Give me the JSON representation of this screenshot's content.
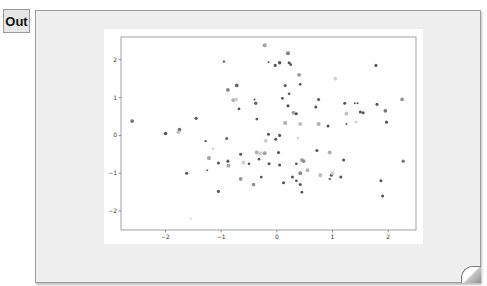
{
  "cell": {
    "prompt_label": "Out"
  },
  "chart_data": {
    "type": "scatter",
    "title": "",
    "xlabel": "",
    "ylabel": "",
    "xlim": [
      -2.8,
      2.5
    ],
    "ylim": [
      -2.5,
      2.6
    ],
    "grid": false,
    "legend": null,
    "xticks": [
      "-2",
      "-1",
      "0",
      "1",
      "2"
    ],
    "yticks": [
      "-2",
      "-1",
      "0",
      "1",
      "2"
    ],
    "points": [
      {
        "x": -2.6,
        "y": 0.38,
        "c": "#666666",
        "s": 2.2
      },
      {
        "x": -2.0,
        "y": 0.05,
        "c": "#444444",
        "s": 2.0
      },
      {
        "x": -1.75,
        "y": 0.15,
        "c": "#666666",
        "s": 2.2
      },
      {
        "x": -1.77,
        "y": 0.08,
        "c": "#bbbbbb",
        "s": 2.2
      },
      {
        "x": -1.45,
        "y": 0.45,
        "c": "#444444",
        "s": 1.8
      },
      {
        "x": -1.62,
        "y": -1.0,
        "c": "#444444",
        "s": 1.8
      },
      {
        "x": -1.55,
        "y": -2.2,
        "c": "#dddddd",
        "s": 1.6
      },
      {
        "x": -1.28,
        "y": -0.15,
        "c": "#444444",
        "s": 1.4
      },
      {
        "x": -1.22,
        "y": -0.6,
        "c": "#999999",
        "s": 2.4
      },
      {
        "x": -1.25,
        "y": -0.92,
        "c": "#555555",
        "s": 1.2
      },
      {
        "x": -1.15,
        "y": -0.35,
        "c": "#cccccc",
        "s": 1.4
      },
      {
        "x": -1.05,
        "y": -0.73,
        "c": "#444444",
        "s": 1.8
      },
      {
        "x": -1.05,
        "y": -1.48,
        "c": "#444444",
        "s": 1.8
      },
      {
        "x": -0.95,
        "y": 1.95,
        "c": "#444444",
        "s": 1.4
      },
      {
        "x": -0.88,
        "y": 1.2,
        "c": "#777777",
        "s": 2.2
      },
      {
        "x": -0.78,
        "y": 0.93,
        "c": "#aaaaaa",
        "s": 2.4
      },
      {
        "x": -0.73,
        "y": 0.95,
        "c": "#cccccc",
        "s": 2.2
      },
      {
        "x": -0.72,
        "y": 1.32,
        "c": "#555555",
        "s": 2.2
      },
      {
        "x": -0.88,
        "y": -0.68,
        "c": "#444444",
        "s": 1.8
      },
      {
        "x": -0.87,
        "y": -0.8,
        "c": "#999999",
        "s": 2.2
      },
      {
        "x": -0.9,
        "y": -0.08,
        "c": "#555555",
        "s": 1.8
      },
      {
        "x": -0.68,
        "y": 0.7,
        "c": "#444444",
        "s": 1.6
      },
      {
        "x": -0.65,
        "y": -1.15,
        "c": "#888888",
        "s": 2.2
      },
      {
        "x": -0.65,
        "y": -0.5,
        "c": "#444444",
        "s": 1.8
      },
      {
        "x": -0.6,
        "y": -0.72,
        "c": "#cccccc",
        "s": 2.4
      },
      {
        "x": -0.5,
        "y": -0.75,
        "c": "#444444",
        "s": 1.6
      },
      {
        "x": -0.42,
        "y": -1.3,
        "c": "#888888",
        "s": 2.2
      },
      {
        "x": -0.36,
        "y": 0.43,
        "c": "#444444",
        "s": 1.6
      },
      {
        "x": -0.36,
        "y": -0.45,
        "c": "#aaaaaa",
        "s": 2.4
      },
      {
        "x": -0.3,
        "y": -0.47,
        "c": "#cccccc",
        "s": 2.4
      },
      {
        "x": -0.22,
        "y": -0.47,
        "c": "#999999",
        "s": 2.4
      },
      {
        "x": -0.32,
        "y": -0.63,
        "c": "#444444",
        "s": 1.6
      },
      {
        "x": -0.28,
        "y": -1.1,
        "c": "#444444",
        "s": 1.6
      },
      {
        "x": -0.4,
        "y": 0.95,
        "c": "#444444",
        "s": 1.2
      },
      {
        "x": -0.38,
        "y": 0.85,
        "c": "#555555",
        "s": 2.0
      },
      {
        "x": -0.14,
        "y": -0.75,
        "c": "#444444",
        "s": 1.8
      },
      {
        "x": -0.2,
        "y": -0.14,
        "c": "#cccccc",
        "s": 2.4
      },
      {
        "x": -0.15,
        "y": 0.03,
        "c": "#444444",
        "s": 1.8
      },
      {
        "x": -0.22,
        "y": 2.38,
        "c": "#999999",
        "s": 2.4
      },
      {
        "x": -0.15,
        "y": 1.93,
        "c": "#444444",
        "s": 1.2
      },
      {
        "x": -0.03,
        "y": 1.85,
        "c": "#444444",
        "s": 1.8
      },
      {
        "x": 0.05,
        "y": 1.92,
        "c": "#444444",
        "s": 2.0
      },
      {
        "x": -0.02,
        "y": -0.1,
        "c": "#444444",
        "s": 1.8
      },
      {
        "x": 0.03,
        "y": -0.45,
        "c": "#444444",
        "s": 1.8
      },
      {
        "x": 0.05,
        "y": 0.0,
        "c": "#444444",
        "s": 1.8
      },
      {
        "x": 0.05,
        "y": -0.78,
        "c": "#444444",
        "s": 1.8
      },
      {
        "x": 0.15,
        "y": 0.33,
        "c": "#aaaaaa",
        "s": 2.4
      },
      {
        "x": 0.12,
        "y": -1.25,
        "c": "#444444",
        "s": 1.8
      },
      {
        "x": 0.1,
        "y": 0.98,
        "c": "#444444",
        "s": 1.6
      },
      {
        "x": 0.15,
        "y": 1.32,
        "c": "#444444",
        "s": 1.8
      },
      {
        "x": 0.2,
        "y": 2.17,
        "c": "#777777",
        "s": 2.4
      },
      {
        "x": 0.22,
        "y": 1.92,
        "c": "#444444",
        "s": 1.8
      },
      {
        "x": 0.25,
        "y": 1.87,
        "c": "#444444",
        "s": 1.6
      },
      {
        "x": 0.22,
        "y": 1.1,
        "c": "#444444",
        "s": 1.6
      },
      {
        "x": 0.2,
        "y": 0.78,
        "c": "#444444",
        "s": 1.8
      },
      {
        "x": 0.3,
        "y": 0.6,
        "c": "#999999",
        "s": 2.4
      },
      {
        "x": 0.28,
        "y": -1.1,
        "c": "#444444",
        "s": 1.8
      },
      {
        "x": 0.35,
        "y": 0.57,
        "c": "#444444",
        "s": 1.8
      },
      {
        "x": 0.4,
        "y": 1.6,
        "c": "#888888",
        "s": 2.2
      },
      {
        "x": 0.42,
        "y": 1.35,
        "c": "#444444",
        "s": 1.6
      },
      {
        "x": 0.42,
        "y": 0.3,
        "c": "#bbbbbb",
        "s": 2.4
      },
      {
        "x": 0.38,
        "y": -0.07,
        "c": "#cccccc",
        "s": 1.4
      },
      {
        "x": 0.42,
        "y": -1.0,
        "c": "#777777",
        "s": 2.2
      },
      {
        "x": 0.42,
        "y": -1.3,
        "c": "#444444",
        "s": 1.8
      },
      {
        "x": 0.45,
        "y": -1.5,
        "c": "#444444",
        "s": 1.6
      },
      {
        "x": 0.45,
        "y": -0.65,
        "c": "#999999",
        "s": 2.2
      },
      {
        "x": 0.48,
        "y": -0.68,
        "c": "#888888",
        "s": 2.2
      },
      {
        "x": 0.35,
        "y": -0.75,
        "c": "#444444",
        "s": 1.6
      },
      {
        "x": 0.35,
        "y": -1.2,
        "c": "#444444",
        "s": 1.6
      },
      {
        "x": 0.55,
        "y": -0.92,
        "c": "#aaaaaa",
        "s": 2.2
      },
      {
        "x": 0.7,
        "y": 0.75,
        "c": "#444444",
        "s": 1.8
      },
      {
        "x": 0.75,
        "y": 0.95,
        "c": "#444444",
        "s": 1.8
      },
      {
        "x": 0.78,
        "y": -1.05,
        "c": "#bbbbbb",
        "s": 2.4
      },
      {
        "x": 0.72,
        "y": -0.4,
        "c": "#444444",
        "s": 1.8
      },
      {
        "x": 0.75,
        "y": 0.3,
        "c": "#aaaaaa",
        "s": 2.4
      },
      {
        "x": 0.92,
        "y": 0.25,
        "c": "#444444",
        "s": 1.8
      },
      {
        "x": 0.95,
        "y": -0.45,
        "c": "#aaaaaa",
        "s": 2.4
      },
      {
        "x": 0.95,
        "y": -1.15,
        "c": "#555555",
        "s": 1.4
      },
      {
        "x": 0.98,
        "y": -1.05,
        "c": "#444444",
        "s": 1.8
      },
      {
        "x": 1.0,
        "y": -1.0,
        "c": "#cccccc",
        "s": 2.4
      },
      {
        "x": 1.05,
        "y": 1.5,
        "c": "#cccccc",
        "s": 2.2
      },
      {
        "x": 1.15,
        "y": -1.1,
        "c": "#444444",
        "s": 1.8
      },
      {
        "x": 1.2,
        "y": -0.65,
        "c": "#444444",
        "s": 1.8
      },
      {
        "x": 1.22,
        "y": 0.85,
        "c": "#444444",
        "s": 1.8
      },
      {
        "x": 1.25,
        "y": 0.57,
        "c": "#bbbbbb",
        "s": 2.4
      },
      {
        "x": 1.4,
        "y": 0.85,
        "c": "#444444",
        "s": 1.2
      },
      {
        "x": 1.45,
        "y": 0.85,
        "c": "#444444",
        "s": 1.2
      },
      {
        "x": 1.42,
        "y": 0.35,
        "c": "#cccccc",
        "s": 1.6
      },
      {
        "x": 1.5,
        "y": 0.62,
        "c": "#444444",
        "s": 1.8
      },
      {
        "x": 1.25,
        "y": 0.3,
        "c": "#444444",
        "s": 1.2
      },
      {
        "x": 1.55,
        "y": 0.6,
        "c": "#444444",
        "s": 1.8
      },
      {
        "x": 1.78,
        "y": 1.85,
        "c": "#444444",
        "s": 1.8
      },
      {
        "x": 1.8,
        "y": 0.82,
        "c": "#444444",
        "s": 1.8
      },
      {
        "x": 1.87,
        "y": -1.2,
        "c": "#444444",
        "s": 1.8
      },
      {
        "x": 1.9,
        "y": -1.6,
        "c": "#444444",
        "s": 1.8
      },
      {
        "x": 1.95,
        "y": 0.65,
        "c": "#666666",
        "s": 2.2
      },
      {
        "x": 2.25,
        "y": 0.95,
        "c": "#888888",
        "s": 2.2
      },
      {
        "x": 2.27,
        "y": -0.68,
        "c": "#666666",
        "s": 2.0
      },
      {
        "x": 1.97,
        "y": 0.35,
        "c": "#444444",
        "s": 1.8
      }
    ]
  }
}
